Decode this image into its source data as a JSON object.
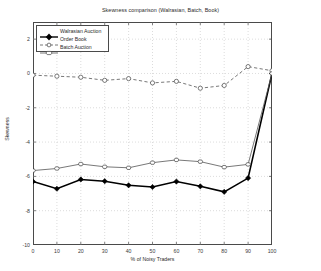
{
  "chart_data": {
    "type": "line",
    "title": "Skewness comparison (Walrasian, Batch, Book)",
    "xlabel": "% of Noisy Traders",
    "ylabel": "Skewness",
    "xlim": [
      0,
      100
    ],
    "ylim": [
      -10,
      3
    ],
    "grid": true,
    "legend_position": "top-left",
    "xticks": [
      "0",
      "10",
      "20",
      "30",
      "40",
      "50",
      "60",
      "70",
      "80",
      "90",
      "100"
    ],
    "yticks": [
      "2",
      "0",
      "-2",
      "-4",
      "-6",
      "-8",
      "-10"
    ],
    "x": [
      0,
      10,
      20,
      30,
      40,
      50,
      60,
      70,
      80,
      90,
      100
    ],
    "series": [
      {
        "name": "Walrasian Auction",
        "marker": "filled-diamond",
        "linestyle": "solid",
        "color": "#000000",
        "linewidth": 1.6,
        "values": [
          -6.3,
          -6.72,
          -6.18,
          -6.28,
          -6.52,
          -6.62,
          -6.3,
          -6.58,
          -6.9,
          -6.1,
          0.0
        ]
      },
      {
        "name": "Order Book",
        "marker": "open-circle",
        "linestyle": "dashed",
        "color": "#555555",
        "linewidth": 0.8,
        "values": [
          -0.1,
          -0.16,
          -0.22,
          -0.4,
          -0.3,
          -0.55,
          -0.46,
          -0.86,
          -0.7,
          0.4,
          0.16
        ]
      },
      {
        "name": "Batch Auction",
        "marker": "open-hexagon",
        "linestyle": "solid",
        "color": "#555555",
        "linewidth": 0.8,
        "values": [
          -5.66,
          -5.54,
          -5.28,
          -5.44,
          -5.5,
          -5.2,
          -5.04,
          -5.14,
          -5.46,
          -5.3,
          0.0
        ]
      }
    ]
  },
  "legend": {
    "items": [
      {
        "label": "Walrasian Auction"
      },
      {
        "label": "Order Book"
      },
      {
        "label": "Batch Auction"
      }
    ]
  }
}
